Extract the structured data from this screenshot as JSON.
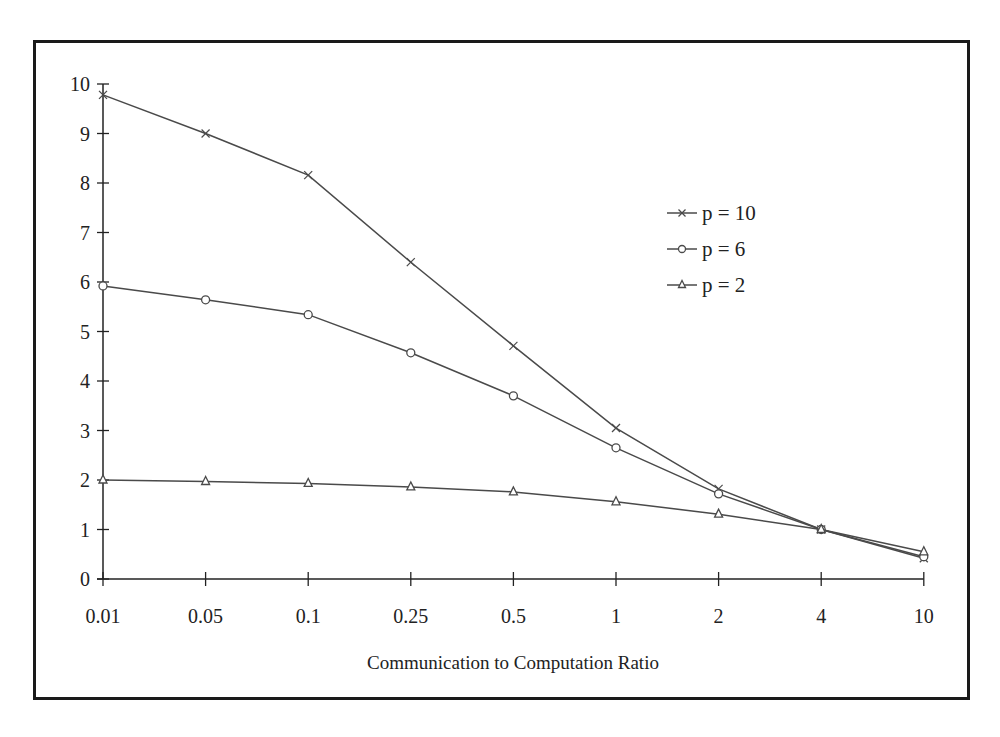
{
  "chart_data": {
    "type": "line",
    "title": "",
    "xlabel": "Communication to Computation Ratio",
    "ylabel": "",
    "x": [
      "0.01",
      "0.05",
      "0.1",
      "0.25",
      "0.5",
      "1",
      "2",
      "4",
      "10"
    ],
    "yticks": [
      "0",
      "1",
      "2",
      "3",
      "4",
      "5",
      "6",
      "7",
      "8",
      "9",
      "10"
    ],
    "ylim": [
      0,
      10
    ],
    "grid": false,
    "legend_position": "upper right (inside plot)",
    "series": [
      {
        "name": "p = 10",
        "marker": "x",
        "values": [
          9.78,
          9.0,
          8.16,
          6.4,
          4.71,
          3.05,
          1.82,
          1.0,
          0.42
        ]
      },
      {
        "name": "p = 6",
        "marker": "circle",
        "values": [
          5.92,
          5.64,
          5.34,
          4.57,
          3.7,
          2.65,
          1.72,
          1.0,
          0.45
        ]
      },
      {
        "name": "p = 2",
        "marker": "triangle",
        "values": [
          2.0,
          1.97,
          1.93,
          1.86,
          1.76,
          1.56,
          1.31,
          1.0,
          0.55
        ]
      }
    ]
  },
  "colors": {
    "line": "#4a4a4a",
    "axis": "#222222",
    "frame": "#1a1a1a",
    "background": "#ffffff"
  }
}
